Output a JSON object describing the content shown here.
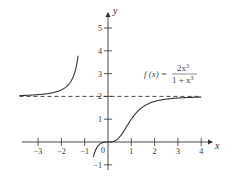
{
  "chart_data": {
    "type": "line",
    "title": "",
    "function_label": "f(x) = 2x^3 / (1 + x^3)",
    "formula": {
      "lhs": "f (x) =",
      "numerator": "2x",
      "numerator_exp": "3",
      "denominator": "1 + x",
      "denominator_exp": "3"
    },
    "xlabel": "x",
    "ylabel": "y",
    "xlim": [
      -3.8,
      4.4
    ],
    "ylim": [
      -1.3,
      5.8
    ],
    "x_ticks": [
      -3,
      -2,
      -1,
      1,
      2,
      3,
      4
    ],
    "x_tick_labels": [
      "−3",
      "−2",
      "−1",
      "1",
      "2",
      "3",
      "4"
    ],
    "y_ticks": [
      -1,
      1,
      2,
      3,
      4,
      5
    ],
    "y_tick_labels": [
      "−1",
      "1",
      "2",
      "3",
      "4",
      "5"
    ],
    "origin_label": "0",
    "asymptotes": [
      {
        "type": "horizontal",
        "y": 2,
        "style": "dashed"
      },
      {
        "type": "vertical",
        "x": -1,
        "style": "none"
      }
    ],
    "series": [
      {
        "name": "left branch",
        "x": [
          -3.8,
          -3.5,
          -3,
          -2.5,
          -2,
          -1.75,
          -1.5,
          -1.4,
          -1.3
        ],
        "y": [
          2.04,
          2.05,
          2.08,
          2.14,
          2.29,
          2.48,
          2.86,
          3.12,
          5.0
        ]
      },
      {
        "name": "right branch",
        "x": [
          -0.63,
          -0.5,
          -0.3,
          0,
          0.3,
          0.5,
          0.8,
          1,
          1.5,
          2,
          2.5,
          3,
          3.5,
          4
        ],
        "y": [
          -1.0,
          -0.29,
          -0.06,
          0,
          0.05,
          0.22,
          0.68,
          1.0,
          1.54,
          1.78,
          1.88,
          1.93,
          1.95,
          1.97
        ]
      }
    ],
    "grid": false,
    "legend": "none",
    "colors": {
      "curve": "#333333",
      "axes": "#333333",
      "asymptote": "#333333"
    }
  }
}
